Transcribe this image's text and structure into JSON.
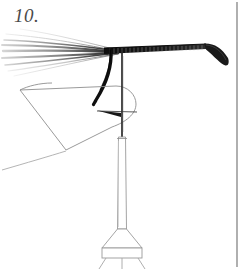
{
  "plate": {
    "figure_number": "10.",
    "background_color": "#ffffff",
    "ink_dark": "#1c1c1c",
    "ink_mid": "#6b6b6b",
    "ink_light": "#b9b9b9",
    "label_color": "#4a4a4a",
    "width": 250,
    "height": 269
  },
  "border": {
    "name": "plate-rule",
    "orientation": "vertical",
    "x": 237,
    "y_top": 2,
    "y_bottom": 267,
    "color": "#6e6e6e",
    "stroke_width": 1.1
  },
  "parts": {
    "fiber_fan": {
      "name": "fiber-fan",
      "description": "fine hair-like fibers fanning to the left",
      "strand_count": 9,
      "color_dark": "#2a2a2a",
      "color_faint": "#c9c9c9",
      "origin_x": 118,
      "origin_y": 52
    },
    "main_shaft": {
      "name": "ribbed-shaft",
      "description": "dark ribbed horizontal shaft tapering to the right",
      "x_start": 104,
      "y_start": 50,
      "x_end": 206,
      "y_end": 46,
      "thickness_left": 5.5,
      "thickness_right": 3.0,
      "rib_count": 26,
      "color": "#141414"
    },
    "bent_tip": {
      "name": "bent-tip",
      "description": "tapered tip bending down and to the right",
      "x_start": 206,
      "y_start": 46,
      "x_end": 228,
      "y_end": 66,
      "color": "#1a1a1a"
    },
    "hook_curve": {
      "name": "hook-curve",
      "description": "heavy curved black stroke descending from the shaft",
      "x_top": 110,
      "y_top": 52,
      "x_bottom": 96,
      "y_bottom": 104,
      "color": "#101010",
      "stroke_width": 3.2
    },
    "wing_outline": {
      "name": "wing-outline",
      "description": "thin outlined wing/sail panel at lower left",
      "apex_x": 20,
      "apex_y": 90,
      "color": "#8a8a8a",
      "stroke_width": 0.9
    },
    "trailing_line": {
      "name": "trailing-line",
      "description": "thin line running to the lower left edge",
      "x_start": 64,
      "y_start": 152,
      "x_end": 2,
      "y_end": 170,
      "color": "#a8a8a8"
    },
    "barb": {
      "name": "barb-arrow",
      "description": "dark wedge pointing left at the crossbar",
      "x": 122,
      "y": 113,
      "color": "#161616"
    },
    "vertical_rod": {
      "name": "vertical-rod",
      "description": "thin dark rod below the crossbar",
      "x": 122,
      "y_top": 50,
      "y_bottom": 136,
      "color": "#2b2b2b",
      "stroke_width": 1.6
    },
    "column": {
      "name": "column-tube",
      "description": "long outlined tube/column",
      "x_center": 122,
      "y_top": 136,
      "y_bottom": 228,
      "width_top": 7,
      "width_bottom": 9,
      "color": "#9a9a9a"
    },
    "cone": {
      "name": "cone-flare",
      "description": "funnel flaring outward at the base of the column",
      "y_top": 228,
      "y_bottom": 248,
      "half_width_top": 5,
      "half_width_bottom": 20,
      "color": "#9a9a9a"
    },
    "base_box": {
      "name": "base-block",
      "description": "rectangular block beneath the cone",
      "x_left": 102,
      "x_right": 142,
      "y_top": 248,
      "y_bottom": 258,
      "color": "#9a9a9a"
    },
    "legs": {
      "name": "base-legs",
      "description": "splayed legs below the base block",
      "count": 3,
      "y_top": 258,
      "y_bottom": 269,
      "color": "#a5a5a5"
    }
  }
}
